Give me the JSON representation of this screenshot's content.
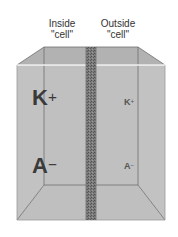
{
  "labels": {
    "inside": {
      "line1": "Inside",
      "line2": "\"cell\""
    },
    "outside": {
      "line1": "Outside",
      "line2": "\"cell\""
    }
  },
  "ions": {
    "inside_cation": {
      "symbol": "K",
      "charge": "+"
    },
    "inside_anion": {
      "symbol": "A",
      "charge": "−"
    },
    "outside_cation": {
      "symbol": "K",
      "charge": "+"
    },
    "outside_anion": {
      "symbol": "A",
      "charge": "−"
    }
  },
  "colors": {
    "front_face": "#c4c4c4",
    "back_face": "#b9b9b9",
    "top_face": "#b3b3b3",
    "floor": "#bdbdbd",
    "membrane": "#7a7a7a",
    "edge": "#777777"
  }
}
